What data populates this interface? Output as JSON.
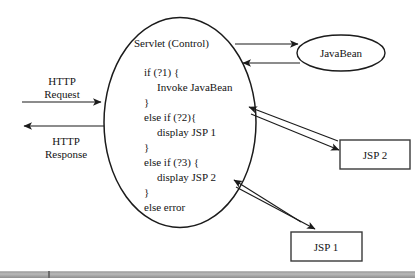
{
  "diagram": {
    "colors": {
      "stroke": "#1b1b1b",
      "text": "#141414",
      "box_stroke": "#3a3a3a",
      "background": "#ffffff",
      "bottom_bar": "#9a9a9a"
    },
    "servlet": {
      "label": "Servlet (Control)",
      "code_lines": [
        "if (?1) {",
        "Invoke JavaBean",
        "}",
        "else if (?2){",
        "display JSP 1",
        "}",
        "else if (?3) {",
        "display JSP 2",
        "}",
        "else error"
      ]
    },
    "javabean": {
      "label": "JavaBean"
    },
    "jsp2": {
      "label": "JSP 2"
    },
    "jsp1": {
      "label": "JSP 1"
    },
    "edges": {
      "http_request": {
        "label_line1": "HTTP",
        "label_line2": "Request",
        "direction": "right"
      },
      "http_response": {
        "label_line1": "HTTP",
        "label_line2": "Response",
        "direction": "left"
      },
      "servlet_to_javabean": {
        "direction": "right"
      },
      "javabean_to_servlet": {
        "direction": "left"
      },
      "servlet_jsp2": {
        "direction": "bidirectional"
      },
      "servlet_jsp1": {
        "direction": "bidirectional"
      }
    }
  }
}
